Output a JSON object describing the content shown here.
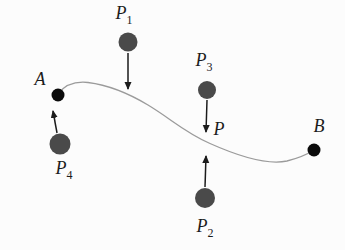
{
  "diagram": {
    "labels": {
      "p1": {
        "base": "P",
        "sub": "1"
      },
      "p2": {
        "base": "P",
        "sub": "2"
      },
      "p3": {
        "base": "P",
        "sub": "3"
      },
      "p4": {
        "base": "P",
        "sub": "4"
      },
      "p": {
        "base": "P",
        "sub": ""
      },
      "a": {
        "base": "A",
        "sub": ""
      },
      "b": {
        "base": "B",
        "sub": ""
      }
    },
    "colors": {
      "charge_fill": "#4a4a4a",
      "endpoint_fill": "#0b0b0b",
      "curve_stroke": "#9b9b9b",
      "arrow_stroke": "#1b1b1b"
    }
  }
}
